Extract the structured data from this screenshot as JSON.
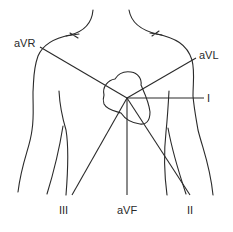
{
  "diagram": {
    "title": "",
    "leads": [
      {
        "id": "aVR",
        "label": "aVR"
      },
      {
        "id": "aVL",
        "label": "aVL"
      },
      {
        "id": "I",
        "label": "I"
      },
      {
        "id": "II",
        "label": "II"
      },
      {
        "id": "III",
        "label": "III"
      },
      {
        "id": "aVF",
        "label": "aVF"
      }
    ],
    "colors": {
      "line": "#2a2a2a",
      "background": "#ffffff"
    }
  }
}
